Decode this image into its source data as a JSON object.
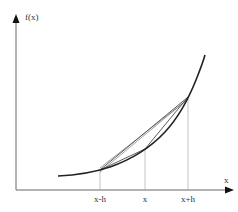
{
  "diagram": {
    "y_axis_label": "f(x)",
    "x_axis_label": "x",
    "tick_labels": [
      "x-h",
      "x",
      "x+h"
    ],
    "points": {
      "left": {
        "label": "x-h",
        "px": 100,
        "py": 170
      },
      "center": {
        "label": "x",
        "px": 145,
        "py": 149
      },
      "right": {
        "label": "x+h",
        "px": 188,
        "py": 97
      }
    },
    "colors": {
      "curve": "#222222",
      "axis": "#555555",
      "secant": "#333333",
      "guide": "#999999"
    }
  }
}
